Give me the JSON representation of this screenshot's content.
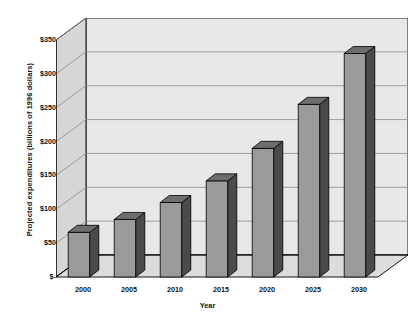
{
  "chart_data": {
    "type": "bar",
    "title": "",
    "xlabel": "Year",
    "ylabel": "Projected expenditures (billions of 1996 dollars)",
    "categories": [
      "2000",
      "2005",
      "2010",
      "2015",
      "2020",
      "2025",
      "2030"
    ],
    "values": [
      66,
      85,
      110,
      142,
      190,
      255,
      330
    ],
    "ylim": [
      0,
      350
    ],
    "ytick_values": [
      0,
      50,
      100,
      150,
      200,
      250,
      300,
      350
    ],
    "ytick_labels": [
      "$-",
      "$50",
      "$100",
      "$150",
      "$200",
      "$250",
      "$300",
      "$350"
    ],
    "grid": true,
    "legend": "none",
    "style": "3d-column",
    "colors": {
      "bar_front": "#9a9a9a",
      "bar_side": "#4a4a4a",
      "bar_top": "#6e6e6e",
      "plot_back_wall": "#e8e8e8",
      "plot_side_wall": "#d6d6d6",
      "plot_floor": "#dcdcdc",
      "gridline": "#8a8a8a",
      "axis_line": "#000000",
      "text": "#111111"
    }
  },
  "axes": {
    "y_title": "Projected expenditures (billions of 1996 dollars)",
    "x_title": "Year"
  }
}
